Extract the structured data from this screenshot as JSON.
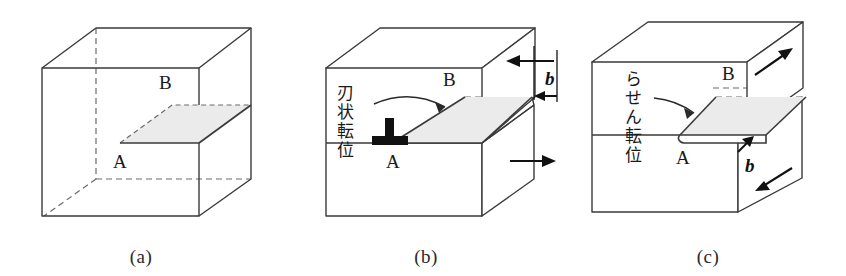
{
  "figure": {
    "background_color": "#ffffff",
    "line_color": "#3a3a3a",
    "slip_plane_fill": "#ebebeb",
    "dashed_style": "hidden-edges"
  },
  "panels": [
    {
      "id": "a",
      "caption": "(a)",
      "description": "Undeformed cube containing an internal slip plane bounded by dislocation line A-B",
      "labels": {
        "point_a": "A",
        "point_b": "B"
      },
      "annotations": [],
      "vectors": [],
      "arrows": []
    },
    {
      "id": "b",
      "caption": "(b)",
      "description": "Edge dislocation: slip direction perpendicular to the dislocation line",
      "labels": {
        "point_a": "A",
        "point_b": "B"
      },
      "annotations": [
        {
          "name": "edge-dislocation-label",
          "text": "刃状転位",
          "reading": "jinjou ten'i",
          "meaning": "edge dislocation",
          "orientation": "vertical"
        }
      ],
      "vectors": [
        {
          "name": "burgers-vector",
          "symbol": "b",
          "style": "bold-italic",
          "direction": "perpendicular-to-line"
        }
      ],
      "arrows": [
        {
          "name": "top-shear-arrow",
          "direction": "left"
        },
        {
          "name": "front-shear-arrow",
          "direction": "right"
        },
        {
          "name": "burgers-arrow",
          "direction": "left"
        },
        {
          "name": "leader-arrow",
          "direction": "curved-to-slip-plane"
        }
      ],
      "symbols": [
        {
          "name": "dislocation-symbol",
          "glyph": "inverted-T",
          "meaning": "edge dislocation line"
        }
      ]
    },
    {
      "id": "c",
      "caption": "(c)",
      "description": "Screw dislocation: slip direction parallel to the dislocation line",
      "labels": {
        "point_a": "A",
        "point_b": "B"
      },
      "annotations": [
        {
          "name": "screw-dislocation-label",
          "text": "らせん転位",
          "reading": "rasen ten'i",
          "meaning": "screw dislocation",
          "orientation": "vertical"
        }
      ],
      "vectors": [
        {
          "name": "burgers-vector",
          "symbol": "b",
          "style": "bold-italic",
          "direction": "parallel-to-line"
        }
      ],
      "arrows": [
        {
          "name": "top-shear-arrow",
          "direction": "up-right"
        },
        {
          "name": "front-shear-arrow",
          "direction": "down-left"
        },
        {
          "name": "burgers-arrow",
          "direction": "up-right"
        },
        {
          "name": "leader-arrow",
          "direction": "curved-to-slip-plane"
        }
      ],
      "symbols": []
    }
  ]
}
